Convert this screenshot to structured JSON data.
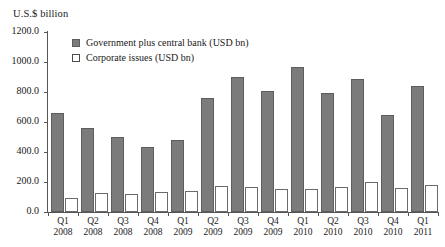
{
  "chart_data": {
    "type": "bar",
    "title": "",
    "subtitle": "",
    "xlabel": "",
    "ylabel": "U.S.$ billion",
    "ylim": [
      0,
      1200
    ],
    "ytick_labels": [
      "0.0",
      "200.0",
      "400.0",
      "600.0",
      "800.0",
      "1000.0",
      "1200.0"
    ],
    "ytick_values": [
      0,
      200,
      400,
      600,
      800,
      1000,
      1200
    ],
    "grid": false,
    "legend_position": "top-left-inside",
    "categories": [
      "Q1 2008",
      "Q2 2008",
      "Q3 2008",
      "Q4 2008",
      "Q1 2009",
      "Q2 2009",
      "Q3 2009",
      "Q4 2009",
      "Q1 2010",
      "Q2 2010",
      "Q3 2010",
      "Q4 2010",
      "Q1 2011"
    ],
    "category_parts": [
      {
        "quarter": "Q1",
        "year": "2008"
      },
      {
        "quarter": "Q2",
        "year": "2008"
      },
      {
        "quarter": "Q3",
        "year": "2008"
      },
      {
        "quarter": "Q4",
        "year": "2008"
      },
      {
        "quarter": "Q1",
        "year": "2009"
      },
      {
        "quarter": "Q2",
        "year": "2009"
      },
      {
        "quarter": "Q3",
        "year": "2009"
      },
      {
        "quarter": "Q4",
        "year": "2009"
      },
      {
        "quarter": "Q1",
        "year": "2010"
      },
      {
        "quarter": "Q2",
        "year": "2010"
      },
      {
        "quarter": "Q3",
        "year": "2010"
      },
      {
        "quarter": "Q4",
        "year": "2010"
      },
      {
        "quarter": "Q1",
        "year": "2011"
      }
    ],
    "series": [
      {
        "name": "Government plus central bank (USD bn)",
        "color": "#7b7b7b",
        "values": [
          660,
          560,
          500,
          433,
          483,
          763,
          900,
          807,
          967,
          793,
          887,
          647,
          837
        ]
      },
      {
        "name": "Corporate issues (USD bn)",
        "color": "#ffffff",
        "values": [
          93,
          127,
          123,
          133,
          140,
          173,
          167,
          153,
          153,
          170,
          197,
          157,
          180
        ]
      }
    ]
  },
  "legend": {
    "items": [
      {
        "label": "Government plus central bank (USD bn)",
        "style": "gov"
      },
      {
        "label": "Corporate issues (USD bn)",
        "style": "corp"
      }
    ]
  }
}
